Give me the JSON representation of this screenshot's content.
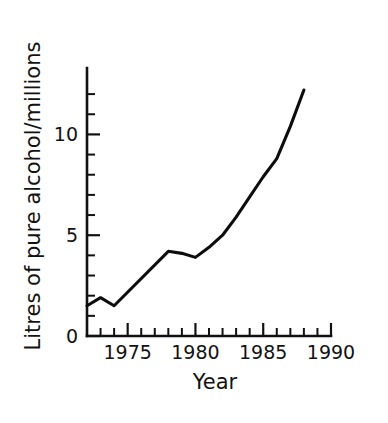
{
  "chart_data": {
    "type": "line",
    "title": "",
    "subtitle": "",
    "xlabel": "Year",
    "ylabel": "Litres of pure alcohol/millions",
    "xlim": [
      1972,
      1990
    ],
    "ylim": [
      0,
      12.6
    ],
    "grid": false,
    "legend": null,
    "x_ticks_major": [
      1975,
      1980,
      1985,
      1990
    ],
    "x_tick_labels": [
      "1975",
      "1980",
      "1985",
      "1990"
    ],
    "x_ticks_minor": [
      1973,
      1974,
      1976,
      1977,
      1978,
      1979,
      1981,
      1982,
      1983,
      1984,
      1986,
      1987,
      1988,
      1989
    ],
    "y_ticks_major": [
      0,
      5,
      10
    ],
    "y_tick_labels": [
      "0",
      "5",
      "10"
    ],
    "y_ticks_minor": [
      1,
      2,
      3,
      4,
      6,
      7,
      8,
      9,
      11,
      12
    ],
    "series": [
      {
        "name": "Litres of pure alcohol",
        "x": [
          1972,
          1973,
          1974,
          1978,
          1979,
          1980,
          1981,
          1982,
          1983,
          1984,
          1985,
          1986,
          1987,
          1988
        ],
        "values": [
          1.5,
          1.9,
          1.5,
          4.2,
          4.1,
          3.9,
          4.4,
          5.0,
          5.9,
          6.9,
          7.9,
          8.8,
          10.4,
          12.2
        ]
      }
    ],
    "annotations": []
  },
  "axis_titles": {
    "x": "Year",
    "y": "Litres of pure alcohol/millions"
  }
}
